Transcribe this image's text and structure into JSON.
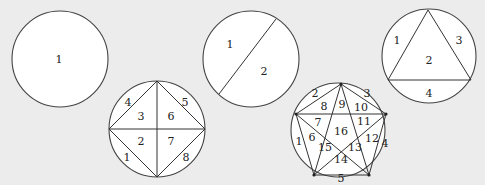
{
  "diagrams": [
    {
      "id": "circle-1-region",
      "description": "Circle with 0 points, 1 region",
      "regions": [
        "1"
      ]
    },
    {
      "id": "circle-2-regions",
      "description": "Circle with one chord, 2 regions",
      "regions": [
        "1",
        "2"
      ]
    },
    {
      "id": "circle-4-regions",
      "description": "Circle with inscribed triangle, 4 regions",
      "regions": [
        "1",
        "2",
        "3",
        "4"
      ]
    },
    {
      "id": "circle-8-regions",
      "description": "Circle with inscribed square and diagonals, 8 regions",
      "regions": [
        "1",
        "2",
        "3",
        "4",
        "5",
        "6",
        "7",
        "8"
      ]
    },
    {
      "id": "circle-16-regions",
      "description": "Circle with inscribed pentagon and all diagonals, 16 regions",
      "regions": [
        "1",
        "2",
        "3",
        "4",
        "5",
        "6",
        "7",
        "8",
        "9",
        "10",
        "11",
        "12",
        "13",
        "14",
        "15",
        "16"
      ]
    }
  ],
  "colors": {
    "background": "#ececec",
    "circle_fill": "#ffffff",
    "stroke": "#333333"
  }
}
